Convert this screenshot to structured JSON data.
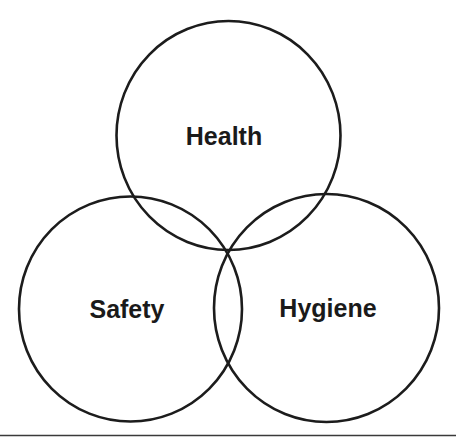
{
  "diagram": {
    "type": "venn",
    "sets": [
      {
        "id": "health",
        "label": "Health",
        "position": "top"
      },
      {
        "id": "safety",
        "label": "Safety",
        "position": "bottom-left"
      },
      {
        "id": "hygiene",
        "label": "Hygiene",
        "position": "bottom-right"
      }
    ],
    "colors": {
      "stroke": "#1c1c1c",
      "text": "#1a1a1a",
      "background": "#ffffff",
      "rule": "#3a3a3a"
    }
  }
}
